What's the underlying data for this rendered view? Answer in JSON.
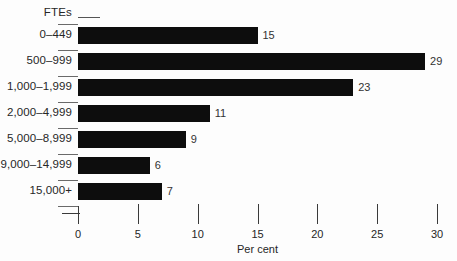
{
  "chart_data": {
    "type": "bar",
    "orientation": "horizontal",
    "title": "",
    "xlabel": "Per cent",
    "ylabel": "FTEs",
    "categories": [
      "0–449",
      "500–999",
      "1,000–1,999",
      "2,000–4,999",
      "5,000–8,999",
      "9,000–14,999",
      "15,000+"
    ],
    "values": [
      15,
      29,
      23,
      11,
      9,
      6,
      7
    ],
    "value_labels": [
      "15",
      "29",
      "23",
      "11",
      "9",
      "6",
      "7"
    ],
    "xlim": [
      0,
      30
    ],
    "xticks": [
      0,
      5,
      10,
      15,
      20,
      25,
      30
    ],
    "xtick_labels": [
      "0",
      "5",
      "10",
      "15",
      "20",
      "25",
      "30"
    ],
    "grid": false,
    "legend": null,
    "bar_color": "#0d0d0d",
    "background_color": "#fdfdfd"
  }
}
